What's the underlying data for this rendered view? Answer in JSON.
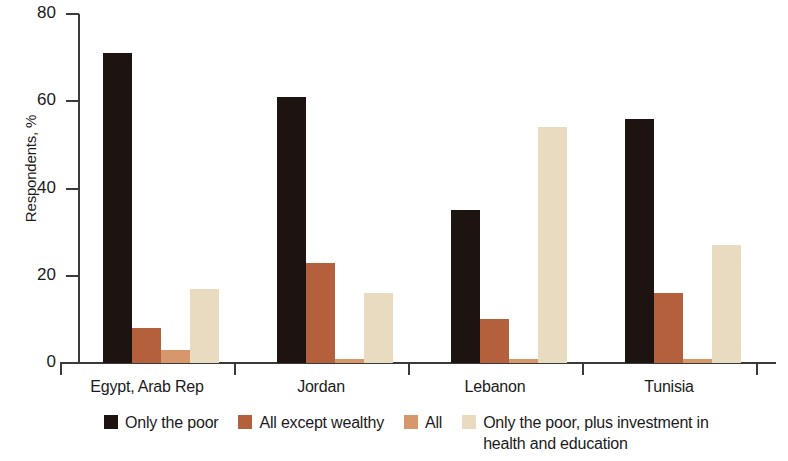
{
  "chart_data": {
    "type": "bar",
    "title": "",
    "xlabel": "",
    "ylabel": "Respondents, %",
    "ylim": [
      0,
      80
    ],
    "yticks": [
      0,
      20,
      40,
      60,
      80
    ],
    "grid": false,
    "legend_position": "bottom",
    "categories": [
      "Egypt, Arab Rep",
      "Jordan",
      "Lebanon",
      "Tunisia"
    ],
    "series": [
      {
        "name": "Only the poor",
        "color": "#1d1310",
        "values": [
          71,
          61,
          35,
          56
        ]
      },
      {
        "name": "All except wealthy",
        "color": "#b4603c",
        "values": [
          8,
          23,
          10,
          16
        ]
      },
      {
        "name": "All",
        "color": "#d8976a",
        "values": [
          3,
          1,
          1,
          1
        ]
      },
      {
        "name": "Only the poor, plus investment in\nhealth and education",
        "color": "#e9dbc0",
        "values": [
          17,
          16,
          54,
          27
        ]
      }
    ]
  },
  "axis": {
    "y_tick_labels": [
      "80",
      "60",
      "40",
      "20",
      "0"
    ],
    "y_title": "Respondents, %"
  },
  "legend": {
    "items": [
      {
        "label": "Only the poor",
        "color": "#1d1310"
      },
      {
        "label": "All except wealthy",
        "color": "#b4603c"
      },
      {
        "label": "All",
        "color": "#d8976a"
      },
      {
        "label": "Only the poor, plus investment in\nhealth and education",
        "color": "#e9dbc0"
      }
    ]
  }
}
